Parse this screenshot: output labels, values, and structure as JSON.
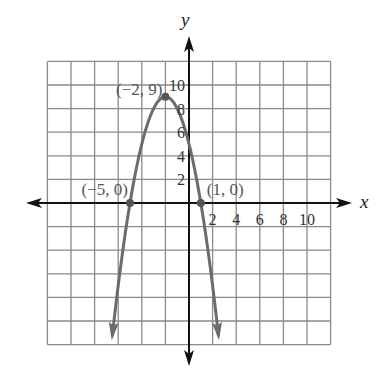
{
  "chart_data": {
    "type": "line",
    "title": "",
    "xlabel": "x",
    "ylabel": "y",
    "xlim": [
      -12,
      12
    ],
    "ylim": [
      -12,
      12
    ],
    "grid": true,
    "grid_step": 2,
    "x_ticks": [
      "2",
      "4",
      "6",
      "8",
      "10"
    ],
    "y_ticks": [
      "2",
      "4",
      "6",
      "8",
      "10"
    ],
    "series": [
      {
        "name": "parabola",
        "equation": "y = -(x+2)^2 + 9",
        "points": [
          [
            -5,
            0
          ],
          [
            -4,
            5
          ],
          [
            -3,
            8
          ],
          [
            -2,
            9
          ],
          [
            -1,
            8
          ],
          [
            0,
            5
          ],
          [
            1,
            0
          ]
        ],
        "color": "#6b6b6b"
      }
    ],
    "annotations": [
      {
        "label": "(−2, 9)",
        "x": -2,
        "y": 9
      },
      {
        "label": "(−5, 0)",
        "x": -5,
        "y": 0
      },
      {
        "label": "(1, 0)",
        "x": 1,
        "y": 0
      }
    ]
  },
  "colors": {
    "grid": "#8a8a8a",
    "axis": "#111111",
    "curve": "#6b6b6b",
    "label": "#555555"
  }
}
